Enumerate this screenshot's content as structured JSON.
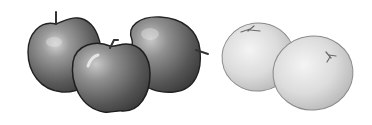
{
  "scene": {
    "description": "Grayscale illustration of three apples and two oranges",
    "background": "#ffffff",
    "groups": [
      {
        "name": "apples",
        "count": 3,
        "items": [
          {
            "id": "apple-left",
            "tone": "dark"
          },
          {
            "id": "apple-front",
            "tone": "dark"
          },
          {
            "id": "apple-right",
            "tone": "dark"
          }
        ]
      },
      {
        "name": "oranges",
        "count": 2,
        "items": [
          {
            "id": "orange-left",
            "tone": "light"
          },
          {
            "id": "orange-right",
            "tone": "light"
          }
        ]
      }
    ],
    "colors": {
      "apple_dark": "#3a3a3a",
      "apple_mid": "#7a7a7a",
      "apple_highlight": "#d8d8d8",
      "apple_outline": "#222222",
      "orange_light": "#e6e6e6",
      "orange_mid": "#bdbdbd",
      "orange_outline": "#8a8a8a"
    }
  }
}
